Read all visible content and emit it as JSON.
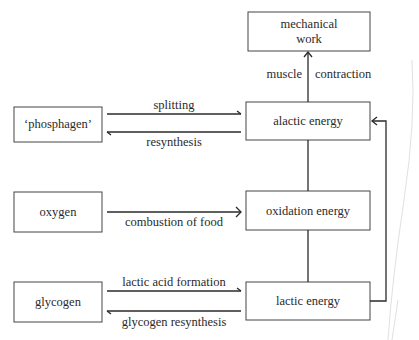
{
  "nodes": {
    "mechanical_work": [
      "mechanical",
      "work"
    ],
    "phosphagen": "‘phosphagen’",
    "alactic_energy": "alactic energy",
    "oxygen": "oxygen",
    "oxidation_energy": "oxidation energy",
    "glycogen": "glycogen",
    "lactic_energy": "lactic energy"
  },
  "edges": {
    "splitting": "splitting",
    "resynthesis": "resynthesis",
    "combustion": "combustion of food",
    "lactic_acid_formation": "lactic acid formation",
    "glycogen_resynthesis": "glycogen resynthesis",
    "muscle": "muscle",
    "contraction": "contraction"
  }
}
